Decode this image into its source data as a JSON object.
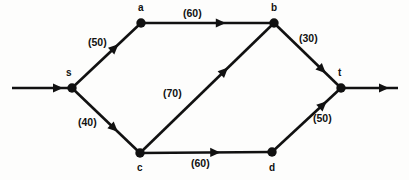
{
  "diagram": {
    "background_color": "#fdfdfc",
    "ink_color": "#111111",
    "nodes": [
      {
        "id": "s",
        "label": "s",
        "x": 72,
        "y": 88,
        "label_x": 66,
        "label_y": 76,
        "role": "source"
      },
      {
        "id": "a",
        "label": "a",
        "x": 141,
        "y": 23,
        "label_x": 138,
        "label_y": 11,
        "role": "intermediate"
      },
      {
        "id": "b",
        "label": "b",
        "x": 274,
        "y": 23,
        "label_x": 271,
        "label_y": 11,
        "role": "intermediate"
      },
      {
        "id": "c",
        "label": "c",
        "x": 140,
        "y": 153,
        "label_x": 137,
        "label_y": 171,
        "role": "intermediate"
      },
      {
        "id": "d",
        "label": "d",
        "x": 272,
        "y": 152,
        "label_x": 269,
        "label_y": 171,
        "role": "intermediate"
      },
      {
        "id": "t",
        "label": "t",
        "x": 341,
        "y": 88,
        "label_x": 338,
        "label_y": 76,
        "role": "sink"
      }
    ],
    "edges": [
      {
        "id": "s-a",
        "from": "s",
        "to": "a",
        "capacity": 50,
        "label": "(50)",
        "label_x": 88,
        "label_y": 46,
        "arrow_t": 0.62
      },
      {
        "id": "a-b",
        "from": "a",
        "to": "b",
        "capacity": 60,
        "label": "(60)",
        "label_x": 183,
        "label_y": 17,
        "arrow_t": 0.6
      },
      {
        "id": "b-t",
        "from": "b",
        "to": "t",
        "capacity": 30,
        "label": "(30)",
        "label_x": 299,
        "label_y": 42,
        "arrow_t": 0.72
      },
      {
        "id": "s-c",
        "from": "s",
        "to": "c",
        "capacity": 40,
        "label": "(40)",
        "label_x": 78,
        "label_y": 126,
        "arrow_t": 0.62
      },
      {
        "id": "c-b",
        "from": "c",
        "to": "b",
        "capacity": 70,
        "label": "(70)",
        "label_x": 163,
        "label_y": 97,
        "arrow_t": 0.63
      },
      {
        "id": "c-d",
        "from": "c",
        "to": "d",
        "capacity": 60,
        "label": "(60)",
        "label_x": 191,
        "label_y": 167,
        "arrow_t": 0.57
      },
      {
        "id": "d-t",
        "from": "d",
        "to": "t",
        "capacity": 50,
        "label": "(50)",
        "label_x": 313,
        "label_y": 122,
        "arrow_t": 0.74
      }
    ],
    "terminals": {
      "source_arrow": {
        "x1": 12,
        "y1": 88,
        "x2": 72,
        "y2": 88,
        "arrow_x": 58,
        "name": "source-inflow-arrow"
      },
      "sink_arrow": {
        "x1": 341,
        "y1": 88,
        "x2": 398,
        "y2": 88,
        "arrow_x": 384,
        "name": "sink-outflow-arrow"
      }
    }
  }
}
